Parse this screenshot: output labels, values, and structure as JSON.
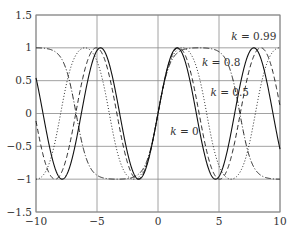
{
  "chart_data": {
    "type": "line",
    "title": "",
    "xlabel": "",
    "ylabel": "",
    "function": "Jacobi elliptic sn(x, k)",
    "xlim": [
      -10,
      10
    ],
    "ylim": [
      -1.5,
      1.5
    ],
    "grid": true,
    "x_ticks": [
      "-10",
      "-5",
      "0",
      "5",
      "10"
    ],
    "x_tick_values": [
      -10,
      -5,
      0,
      5,
      10
    ],
    "y_ticks": [
      "1.5",
      "1",
      "0.5",
      "0",
      "-0.5",
      "-1",
      "-1.5"
    ],
    "y_tick_values": [
      1.5,
      1,
      0.5,
      0,
      -0.5,
      -1,
      -1.5
    ],
    "series": [
      {
        "name": "k = 0",
        "k": 0,
        "style": "solid",
        "color": "#111111"
      },
      {
        "name": "k = 0.5",
        "k": 0.5,
        "style": "dashed",
        "color": "#111111"
      },
      {
        "name": "k = 0.8",
        "k": 0.8,
        "style": "dotted",
        "color": "#111111"
      },
      {
        "name": "k = 0.99",
        "k": 0.99,
        "style": "dashdot",
        "color": "#111111"
      }
    ],
    "annotations": [
      {
        "text_var": "k",
        "text_val": " = 0.99",
        "x": 6.0,
        "y": 1.12
      },
      {
        "text_var": "k",
        "text_val": " = 0.8",
        "x": 3.6,
        "y": 0.72
      },
      {
        "text_var": "k",
        "text_val": " = 0.5",
        "x": 4.3,
        "y": 0.26
      },
      {
        "text_var": "k",
        "text_val": " = 0",
        "x": 1.0,
        "y": -0.33
      }
    ]
  },
  "colors": {
    "grid": "#8a8a8a",
    "axis": "#8a8a8a",
    "curve": "#111111"
  }
}
